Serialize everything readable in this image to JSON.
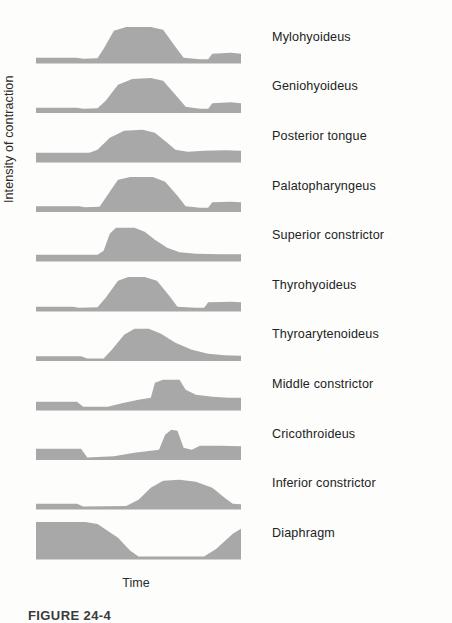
{
  "figure": {
    "caption": "FIGURE 24-4",
    "x_axis_label": "Time",
    "y_axis_label": "Intensity of contraction",
    "fill_color": "#a8a8a8",
    "background_color": "#fdfdfc"
  },
  "chart_data": {
    "type": "area",
    "title": "",
    "subtitle": "",
    "xlabel": "Time",
    "ylabel": "Intensity of contraction",
    "xlim": [
      0,
      100
    ],
    "ylim": [
      0,
      100
    ],
    "grid": false,
    "legend": "none",
    "annotations": [],
    "tick_labels": {
      "x": [],
      "y": []
    },
    "series": [
      {
        "name": "Mylohyoideus",
        "baseline": 12,
        "points": [
          [
            0,
            12
          ],
          [
            20,
            12
          ],
          [
            23,
            10
          ],
          [
            30,
            11
          ],
          [
            33,
            30
          ],
          [
            38,
            66
          ],
          [
            44,
            74
          ],
          [
            56,
            74
          ],
          [
            62,
            68
          ],
          [
            68,
            34
          ],
          [
            72,
            12
          ],
          [
            80,
            9
          ],
          [
            84,
            9
          ],
          [
            86,
            20
          ],
          [
            95,
            22
          ],
          [
            100,
            20
          ]
        ]
      },
      {
        "name": "Geniohyoideus",
        "baseline": 12,
        "points": [
          [
            0,
            12
          ],
          [
            20,
            12
          ],
          [
            23,
            10
          ],
          [
            30,
            11
          ],
          [
            34,
            26
          ],
          [
            40,
            58
          ],
          [
            47,
            70
          ],
          [
            56,
            72
          ],
          [
            62,
            66
          ],
          [
            68,
            38
          ],
          [
            73,
            14
          ],
          [
            80,
            10
          ],
          [
            84,
            10
          ],
          [
            86,
            21
          ],
          [
            95,
            23
          ],
          [
            100,
            21
          ]
        ]
      },
      {
        "name": "Posterior tongue",
        "baseline": 20,
        "points": [
          [
            0,
            20
          ],
          [
            26,
            20
          ],
          [
            30,
            26
          ],
          [
            36,
            50
          ],
          [
            43,
            64
          ],
          [
            52,
            66
          ],
          [
            58,
            60
          ],
          [
            64,
            40
          ],
          [
            68,
            26
          ],
          [
            74,
            22
          ],
          [
            82,
            24
          ],
          [
            92,
            25
          ],
          [
            100,
            24
          ]
        ]
      },
      {
        "name": "Palatopharyngeus",
        "baseline": 13,
        "points": [
          [
            0,
            13
          ],
          [
            21,
            13
          ],
          [
            24,
            11
          ],
          [
            31,
            12
          ],
          [
            34,
            30
          ],
          [
            40,
            66
          ],
          [
            46,
            72
          ],
          [
            57,
            72
          ],
          [
            63,
            62
          ],
          [
            69,
            34
          ],
          [
            73,
            13
          ],
          [
            80,
            10
          ],
          [
            84,
            10
          ],
          [
            86,
            21
          ],
          [
            95,
            22
          ],
          [
            100,
            21
          ]
        ]
      },
      {
        "name": "Superior constrictor",
        "baseline": 14,
        "points": [
          [
            0,
            14
          ],
          [
            30,
            14
          ],
          [
            33,
            22
          ],
          [
            36,
            56
          ],
          [
            39,
            68
          ],
          [
            48,
            68
          ],
          [
            53,
            60
          ],
          [
            58,
            44
          ],
          [
            64,
            28
          ],
          [
            70,
            19
          ],
          [
            78,
            16
          ],
          [
            90,
            15
          ],
          [
            100,
            15
          ]
        ]
      },
      {
        "name": "Thyrohyoideus",
        "baseline": 10,
        "points": [
          [
            0,
            10
          ],
          [
            18,
            10
          ],
          [
            21,
            8
          ],
          [
            30,
            9
          ],
          [
            34,
            28
          ],
          [
            40,
            62
          ],
          [
            45,
            70
          ],
          [
            53,
            70
          ],
          [
            59,
            62
          ],
          [
            65,
            32
          ],
          [
            69,
            10
          ],
          [
            78,
            8
          ],
          [
            82,
            8
          ],
          [
            84,
            19
          ],
          [
            95,
            20
          ],
          [
            100,
            19
          ]
        ]
      },
      {
        "name": "Thyroarytenoideus",
        "baseline": 11,
        "points": [
          [
            0,
            11
          ],
          [
            22,
            11
          ],
          [
            25,
            6
          ],
          [
            33,
            6
          ],
          [
            37,
            24
          ],
          [
            43,
            54
          ],
          [
            48,
            66
          ],
          [
            55,
            66
          ],
          [
            61,
            56
          ],
          [
            68,
            38
          ],
          [
            76,
            24
          ],
          [
            84,
            16
          ],
          [
            92,
            13
          ],
          [
            100,
            12
          ]
        ]
      },
      {
        "name": "Middle constrictor",
        "baseline": 18,
        "points": [
          [
            0,
            18
          ],
          [
            20,
            18
          ],
          [
            23,
            8
          ],
          [
            35,
            8
          ],
          [
            43,
            16
          ],
          [
            50,
            22
          ],
          [
            56,
            26
          ],
          [
            58,
            56
          ],
          [
            62,
            62
          ],
          [
            70,
            62
          ],
          [
            73,
            42
          ],
          [
            78,
            32
          ],
          [
            86,
            28
          ],
          [
            94,
            26
          ],
          [
            100,
            26
          ]
        ]
      },
      {
        "name": "Cricothroideus",
        "baseline": 24,
        "points": [
          [
            0,
            24
          ],
          [
            22,
            24
          ],
          [
            25,
            6
          ],
          [
            38,
            9
          ],
          [
            48,
            16
          ],
          [
            56,
            20
          ],
          [
            60,
            22
          ],
          [
            63,
            52
          ],
          [
            66,
            62
          ],
          [
            69,
            60
          ],
          [
            72,
            26
          ],
          [
            76,
            22
          ],
          [
            80,
            30
          ],
          [
            90,
            30
          ],
          [
            100,
            29
          ]
        ]
      },
      {
        "name": "Inferior constrictor",
        "baseline": 12,
        "points": [
          [
            0,
            12
          ],
          [
            20,
            12
          ],
          [
            23,
            6
          ],
          [
            44,
            7
          ],
          [
            50,
            20
          ],
          [
            56,
            44
          ],
          [
            62,
            58
          ],
          [
            70,
            60
          ],
          [
            78,
            56
          ],
          [
            86,
            44
          ],
          [
            92,
            24
          ],
          [
            96,
            12
          ],
          [
            100,
            11
          ]
        ]
      },
      {
        "name": "Diaphragm",
        "baseline": 0,
        "points": [
          [
            0,
            76
          ],
          [
            24,
            76
          ],
          [
            30,
            72
          ],
          [
            40,
            44
          ],
          [
            46,
            18
          ],
          [
            50,
            6
          ],
          [
            82,
            6
          ],
          [
            88,
            22
          ],
          [
            96,
            52
          ],
          [
            100,
            62
          ]
        ]
      }
    ]
  }
}
